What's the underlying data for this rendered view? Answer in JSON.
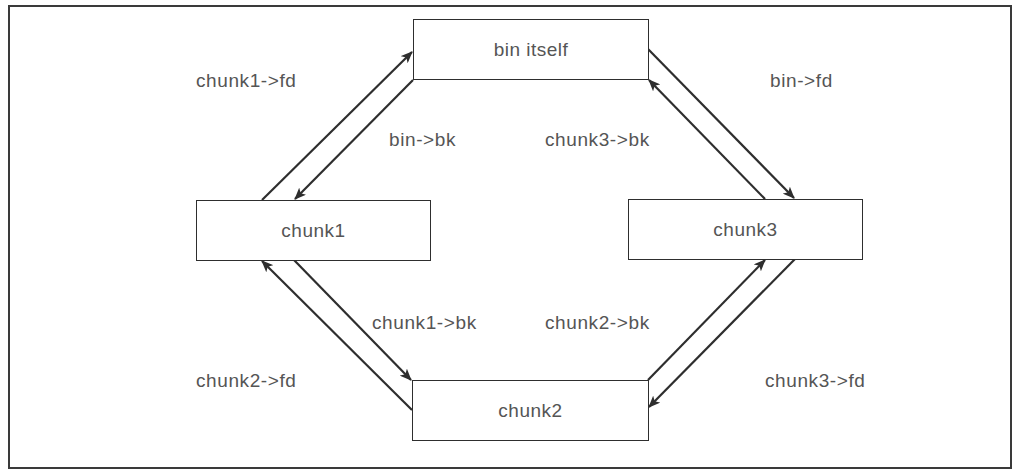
{
  "diagram": {
    "type": "doubly-linked circular list (malloc bin)",
    "nodes": [
      {
        "id": "bin",
        "label": "bin itself"
      },
      {
        "id": "chunk1",
        "label": "chunk1"
      },
      {
        "id": "chunk2",
        "label": "chunk2"
      },
      {
        "id": "chunk3",
        "label": "chunk3"
      }
    ],
    "edges": [
      {
        "from": "chunk1",
        "to": "bin",
        "label": "chunk1->fd"
      },
      {
        "from": "bin",
        "to": "chunk1",
        "label": "bin->bk"
      },
      {
        "from": "bin",
        "to": "chunk3",
        "label": "bin->fd"
      },
      {
        "from": "chunk3",
        "to": "bin",
        "label": "chunk3->bk"
      },
      {
        "from": "chunk1",
        "to": "chunk2",
        "label": "chunk1->bk"
      },
      {
        "from": "chunk2",
        "to": "chunk1",
        "label": "chunk2->fd"
      },
      {
        "from": "chunk2",
        "to": "chunk3",
        "label": "chunk2->bk"
      },
      {
        "from": "chunk3",
        "to": "chunk2",
        "label": "chunk3->fd"
      }
    ]
  },
  "colors": {
    "line": "#2e2e2e",
    "text": "#555555",
    "background": "#ffffff"
  }
}
